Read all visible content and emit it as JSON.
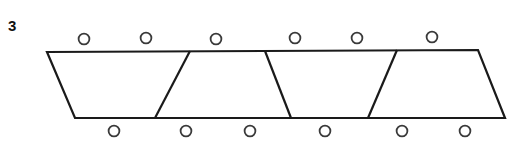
{
  "figure": {
    "label": "3",
    "label_position": {
      "x": 8,
      "y": 18
    },
    "canvas": {
      "width": 527,
      "height": 155,
      "background": "#ffffff"
    },
    "stroke_color": "#1a1a1a",
    "fill_color": "#ffffff",
    "band": {
      "name": "divided-quadrilateral-band",
      "outline_points": "47,52 478,50 505,118 75,118",
      "stroke_width": 2.2,
      "vertices": [
        {
          "name": "top-left",
          "x": 47,
          "y": 52
        },
        {
          "name": "top-right",
          "x": 478,
          "y": 50
        },
        {
          "name": "bottom-right",
          "x": 505,
          "y": 118
        },
        {
          "name": "bottom-left",
          "x": 75,
          "y": 118
        }
      ]
    },
    "dividers": [
      {
        "name": "divider-1",
        "x1": 190,
        "y1": 51,
        "x2": 155,
        "y2": 118,
        "slant": "left"
      },
      {
        "name": "divider-2",
        "x1": 265,
        "y1": 51,
        "x2": 291,
        "y2": 118,
        "slant": "right"
      },
      {
        "name": "divider-3",
        "x1": 397,
        "y1": 50,
        "x2": 368,
        "y2": 118,
        "slant": "left"
      }
    ],
    "sections": [
      {
        "name": "section-1",
        "order": 1
      },
      {
        "name": "section-2",
        "order": 2
      },
      {
        "name": "section-3",
        "order": 3
      },
      {
        "name": "section-4",
        "order": 4
      }
    ],
    "circle_radius": 5.4,
    "circle_stroke_width": 1.8,
    "top_circles": [
      {
        "name": "top-circle-1",
        "cx": 84,
        "cy": 39
      },
      {
        "name": "top-circle-2",
        "cx": 146,
        "cy": 38
      },
      {
        "name": "top-circle-3",
        "cx": 216,
        "cy": 39
      },
      {
        "name": "top-circle-4",
        "cx": 295,
        "cy": 38
      },
      {
        "name": "top-circle-5",
        "cx": 357,
        "cy": 38
      },
      {
        "name": "top-circle-6",
        "cx": 432,
        "cy": 37
      }
    ],
    "bottom_circles": [
      {
        "name": "bottom-circle-1",
        "cx": 114,
        "cy": 131
      },
      {
        "name": "bottom-circle-2",
        "cx": 186,
        "cy": 131
      },
      {
        "name": "bottom-circle-3",
        "cx": 250,
        "cy": 131
      },
      {
        "name": "bottom-circle-4",
        "cx": 325,
        "cy": 131
      },
      {
        "name": "bottom-circle-5",
        "cx": 402,
        "cy": 131
      },
      {
        "name": "bottom-circle-6",
        "cx": 465,
        "cy": 131
      }
    ]
  }
}
